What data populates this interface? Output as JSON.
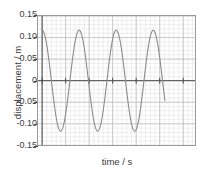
{
  "chart_data": {
    "type": "line",
    "title": "",
    "xlabel": "time / s",
    "ylabel": "displacement / m",
    "xlim": [
      -0.35,
      13.0
    ],
    "ylim": [
      -0.15,
      0.15
    ],
    "grid": true,
    "grid_minor": true,
    "legend": "none",
    "xticks": [
      "0",
      "2",
      "4",
      "6",
      "8",
      "10",
      "12"
    ],
    "xtick_values": [
      0,
      2,
      4,
      6,
      8,
      10,
      12
    ],
    "yticks": [
      "0.15",
      "0.10",
      "0.05",
      "0",
      "-0.05",
      "-0.10",
      "-0.15"
    ],
    "ytick_values": [
      0.15,
      0.1,
      0.05,
      0,
      -0.05,
      -0.1,
      -0.15
    ],
    "series": [
      {
        "name": "displacement",
        "color": "#8a8a8a",
        "waveform": "cosine",
        "amplitude": 0.117,
        "period": 3.15,
        "phase_deg": 0,
        "t_start": 0,
        "t_end": 10.45,
        "x": [
          0,
          0.2,
          0.4,
          0.6,
          0.8,
          1.0,
          1.2,
          1.4,
          1.6,
          1.8,
          2.0,
          2.2,
          2.4,
          2.6,
          2.8,
          3.0,
          3.2,
          3.4,
          3.6,
          3.8,
          4.0,
          4.2,
          4.4,
          4.6,
          4.8,
          5.0,
          5.2,
          5.4,
          5.6,
          5.8,
          6.0,
          6.2,
          6.4,
          6.6,
          6.8,
          7.0,
          7.2,
          7.4,
          7.6,
          7.8,
          8.0,
          8.2,
          8.4,
          8.6,
          8.8,
          9.0,
          9.2,
          9.4,
          9.6,
          9.8,
          10.0,
          10.2,
          10.45
        ],
        "y": [
          0.117,
          0.1,
          0.054,
          -0.006,
          -0.064,
          -0.103,
          -0.117,
          -0.103,
          -0.064,
          -0.006,
          0.054,
          0.1,
          0.117,
          0.103,
          0.064,
          0.006,
          -0.054,
          -0.1,
          -0.117,
          -0.103,
          -0.064,
          -0.006,
          0.054,
          0.1,
          0.117,
          0.103,
          0.064,
          0.006,
          -0.054,
          -0.1,
          -0.117,
          -0.103,
          -0.064,
          -0.006,
          0.054,
          0.1,
          0.117,
          0.103,
          0.064,
          0.006,
          -0.054,
          -0.1,
          -0.117,
          -0.103,
          -0.064,
          -0.006,
          0.054,
          0.1,
          0.117,
          0.103,
          0.064,
          0.006,
          -0.088
        ]
      }
    ],
    "annotations": {
      "zero_axis": "horizontal axis drawn at y = 0",
      "peak_times": [
        0,
        3.15,
        6.3,
        9.45
      ],
      "trough_times": [
        1.58,
        4.73,
        7.88
      ],
      "peak_value": 0.117,
      "trough_value": -0.117
    }
  },
  "colors": {
    "curve": "#8a8a8a",
    "axis": "#4a4a4a",
    "frame": "#9a9a9a",
    "grid_major": "#b9b9b9",
    "grid_minor": "#dedede",
    "text": "#3a3a3a",
    "background": "#ffffff"
  }
}
